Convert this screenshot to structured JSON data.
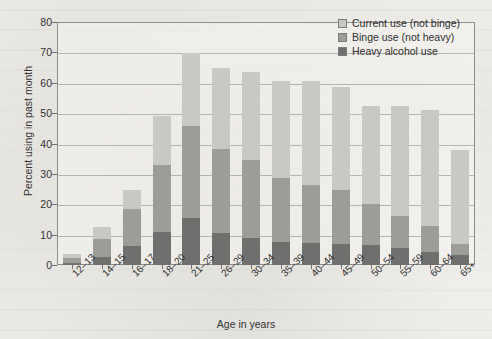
{
  "chart_data": {
    "type": "bar",
    "subtype": "stacked-bar",
    "title": "",
    "xlabel": "Age in years",
    "ylabel": "Percent using in past month",
    "ylim": [
      0,
      80
    ],
    "ytick_step": 10,
    "yticks": [
      0,
      10,
      20,
      30,
      40,
      50,
      60,
      70,
      80
    ],
    "grid": true,
    "legend_position": "top-right",
    "categories": [
      "12–13",
      "14–15",
      "16–17",
      "18–20",
      "21–25",
      "26–29",
      "30–34",
      "35–39",
      "40–44",
      "45–49",
      "50–54",
      "55–59",
      "60–64",
      "65+"
    ],
    "series": [
      {
        "name": "Heavy alcohol use",
        "color": "#6f6f6d",
        "values": [
          0.8,
          2.5,
          6.1,
          11.0,
          15.4,
          10.6,
          9.0,
          7.5,
          7.4,
          7.0,
          6.6,
          5.6,
          4.2,
          3.3
        ]
      },
      {
        "name": "Binge use (not heavy)",
        "color": "#9d9c98",
        "values": [
          1.4,
          6.0,
          12.2,
          22.0,
          30.3,
          27.6,
          25.5,
          21.0,
          19.0,
          17.6,
          13.5,
          10.6,
          8.8,
          3.5
        ]
      },
      {
        "name": "Current use (not binge)",
        "color": "#c9c8c4",
        "values": [
          1.4,
          4.0,
          6.4,
          16.0,
          24.1,
          26.6,
          29.2,
          32.2,
          34.2,
          34.0,
          32.1,
          36.0,
          38.0,
          31.0
        ]
      }
    ],
    "totals": [
      3.6,
      12.5,
      24.7,
      49.0,
      69.8,
      64.8,
      63.7,
      60.7,
      60.6,
      58.6,
      52.2,
      52.2,
      51.0,
      37.8
    ],
    "stack_tops": {
      "heavy": [
        0.8,
        2.5,
        6.1,
        11.0,
        15.4,
        10.6,
        9.0,
        7.5,
        7.4,
        7.0,
        6.6,
        5.6,
        4.2,
        3.3
      ],
      "binge": [
        2.2,
        8.5,
        18.3,
        33.0,
        45.7,
        38.2,
        34.5,
        28.5,
        26.4,
        24.6,
        20.1,
        16.2,
        13.0,
        6.8
      ],
      "current": [
        3.6,
        12.5,
        24.7,
        49.0,
        69.8,
        64.8,
        63.7,
        60.7,
        60.6,
        58.6,
        52.2,
        52.2,
        51.0,
        37.8
      ]
    }
  },
  "legend": {
    "items": [
      {
        "label": "Current use (not binge)",
        "swatch_color": "#c9c8c4"
      },
      {
        "label": "Binge use (not heavy)",
        "swatch_color": "#9d9c98"
      },
      {
        "label": "Heavy alcohol use",
        "swatch_color": "#6f6f6d"
      }
    ]
  },
  "axes": {
    "y_title": "Percent using in past month",
    "x_title": "Age in years",
    "y_tick_labels": [
      "0",
      "10",
      "20",
      "30",
      "40",
      "50",
      "60",
      "70",
      "80"
    ]
  },
  "colors": {
    "background": "#f3f2ee",
    "frame": "#8d8d8d",
    "gridline": "#a9a9a9",
    "text": "#333333"
  }
}
